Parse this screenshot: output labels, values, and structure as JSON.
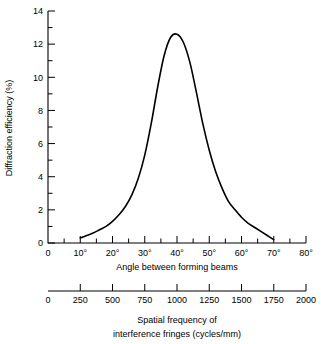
{
  "chart_data": {
    "type": "line",
    "title": "",
    "subtitle": "",
    "ylabel": "Diffraction efficiency (%)",
    "xlabel": "Angle between forming beams",
    "xlabel2_line1": "Spatial frequency of",
    "xlabel2_line2": "interference fringes (cycles/mm)",
    "ylim": [
      0,
      14
    ],
    "xlim": [
      0,
      80
    ],
    "xlim2": [
      0,
      2000
    ],
    "grid": false,
    "legend": null,
    "y_major_ticks": [
      0,
      2,
      4,
      6,
      8,
      10,
      12,
      14
    ],
    "y_tick_labels": [
      "0",
      "2",
      "4",
      "6",
      "8",
      "10",
      "12",
      "14"
    ],
    "y_minor_ticks": [
      1,
      3,
      5,
      7,
      9,
      11,
      13
    ],
    "x_major_ticks": [
      0,
      10,
      20,
      30,
      40,
      50,
      60,
      70,
      80
    ],
    "x_tick_labels": [
      "0",
      "10°",
      "20°",
      "30°",
      "40°",
      "50°",
      "60°",
      "70°",
      "80°"
    ],
    "x_minor_ticks": [
      5,
      15,
      25,
      35,
      45,
      55,
      65,
      75
    ],
    "x2_major_ticks": [
      0,
      250,
      500,
      750,
      1000,
      1250,
      1500,
      1750,
      2000
    ],
    "x2_tick_labels": [
      "0",
      "250",
      "500",
      "750",
      "1000",
      "1250",
      "1500",
      "1750",
      "2000"
    ],
    "series": [
      {
        "name": "Diffraction efficiency",
        "color": "#000000",
        "x": [
          10,
          12,
          14,
          16,
          18,
          20,
          22,
          24,
          26,
          28,
          30,
          32,
          34,
          36,
          38,
          40,
          42,
          44,
          46,
          48,
          50,
          52,
          54,
          56,
          58,
          60,
          62,
          64,
          66,
          68,
          70
        ],
        "y": [
          0.3,
          0.45,
          0.6,
          0.8,
          1.0,
          1.3,
          1.7,
          2.2,
          2.9,
          3.9,
          5.3,
          7.2,
          9.4,
          11.3,
          12.4,
          12.6,
          12.1,
          10.9,
          9.1,
          7.2,
          5.6,
          4.3,
          3.3,
          2.5,
          2.0,
          1.55,
          1.2,
          0.95,
          0.7,
          0.45,
          0.2
        ]
      }
    ],
    "peak": {
      "x": 39,
      "y": 12.6
    }
  },
  "figure": {
    "background_color": "#ffffff",
    "line_color": "#000000"
  }
}
